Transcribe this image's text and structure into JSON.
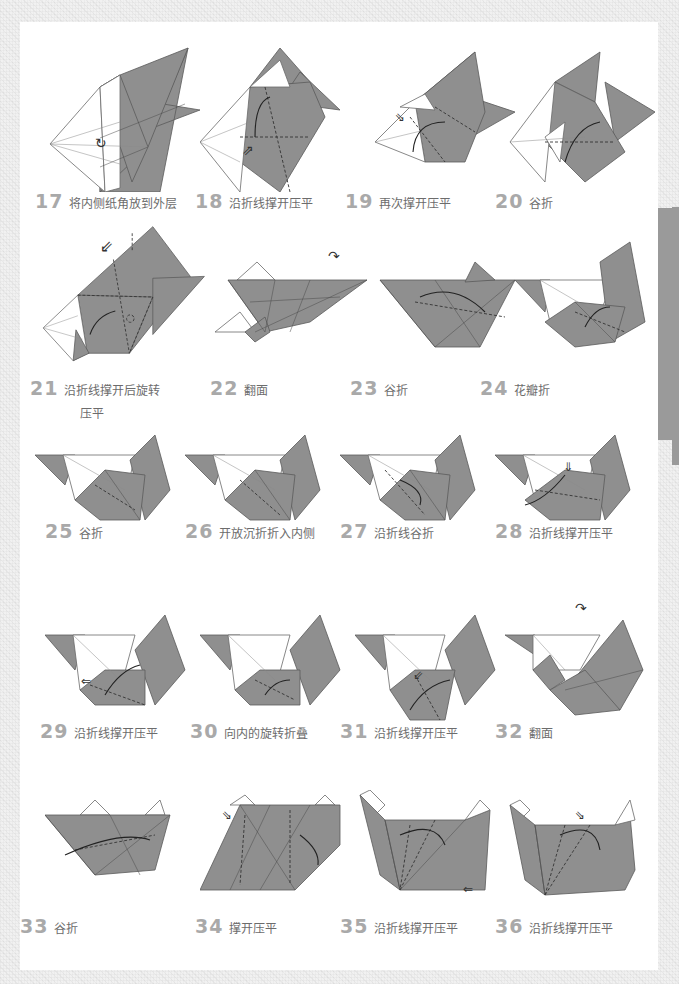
{
  "page": {
    "background_color": "#f1f1f1",
    "paper_gray": "#8f8f8f",
    "number_color": "#a9a9a9",
    "caption_color": "#6c6c6c",
    "side_tab_color": "#9a9a9a"
  },
  "steps": [
    {
      "number": "17",
      "label": "将内侧纸角放到外层",
      "icon": "rotate-inside-icon"
    },
    {
      "number": "18",
      "label": "沿折线撑开压平",
      "icon": "push-arrow-icon"
    },
    {
      "number": "19",
      "label": "再次撑开压平",
      "icon": "push-arrow-icon"
    },
    {
      "number": "20",
      "label": "谷折",
      "icon": "fold-arrow-icon"
    },
    {
      "number": "21",
      "label": "沿折线撑开后旋转",
      "label_line2": "压平",
      "icon": "push-arrow-icon"
    },
    {
      "number": "22",
      "label": "翻面",
      "icon": "flip-over-icon"
    },
    {
      "number": "23",
      "label": "谷折",
      "icon": "fold-arrow-icon"
    },
    {
      "number": "24",
      "label": "花瓣折",
      "icon": "fold-arrow-icon"
    },
    {
      "number": "25",
      "label": "谷折",
      "icon": "fold-arrow-icon"
    },
    {
      "number": "26",
      "label": "开放沉折折入内侧",
      "icon": "fold-arrow-icon"
    },
    {
      "number": "27",
      "label": "沿折线谷折",
      "icon": "fold-arrow-icon"
    },
    {
      "number": "28",
      "label": "沿折线撑开压平",
      "icon": "push-arrow-icon"
    },
    {
      "number": "29",
      "label": "沿折线撑开压平",
      "icon": "push-arrow-icon"
    },
    {
      "number": "30",
      "label": "向内的旋转折叠",
      "icon": "fold-arrow-icon"
    },
    {
      "number": "31",
      "label": "沿折线撑开压平",
      "icon": "push-arrow-icon"
    },
    {
      "number": "32",
      "label": "翻面",
      "icon": "flip-over-icon"
    },
    {
      "number": "33",
      "label": "谷折",
      "icon": "fold-arrow-icon"
    },
    {
      "number": "34",
      "label": "撑开压平",
      "icon": "push-arrow-icon"
    },
    {
      "number": "35",
      "label": "沿折线撑开压平",
      "icon": "push-arrow-icon"
    },
    {
      "number": "36",
      "label": "沿折线撑开压平",
      "icon": "push-arrow-icon"
    }
  ]
}
